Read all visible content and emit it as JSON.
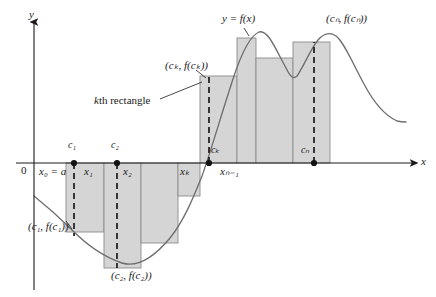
{
  "figure": {
    "title_curve_label": "y = f(x)",
    "axis": {
      "y_label": "y",
      "x_label": "x",
      "origin_label": "0",
      "axis_color": "#1a1a1a",
      "x_axis_y": 163,
      "y_axis_x": 34,
      "x_axis_left": 34,
      "x_axis_right": 418,
      "y_axis_top": 18
    },
    "colors": {
      "rect_fill": "#d5d5d5",
      "rect_stroke": "#8c8c8c",
      "curve": "#6e6e6e",
      "dash": "#1a1a1a",
      "text": "#1a1a1a",
      "background": "#ffffff"
    },
    "annotations": [
      {
        "name": "curve-label",
        "text": "y = f(x)",
        "x": 222,
        "y": 14
      },
      {
        "name": "cn-point-label",
        "text": "(cₙ, f(cₙ))",
        "x": 327,
        "y": 14
      },
      {
        "name": "ck-point-label",
        "text": "(cₖ, f(cₖ))",
        "x": 166,
        "y": 61
      },
      {
        "name": "kth-rectangle-label",
        "text": "kth rectangle",
        "x": 95,
        "y": 97
      },
      {
        "name": "c1-point-label",
        "text": "(c₁, f(c₁))",
        "x": 29,
        "y": 223
      },
      {
        "name": "c2-point-label",
        "text": "(c₂, f(c₂))",
        "x": 112,
        "y": 272
      }
    ],
    "sample_point_labels": [
      {
        "name": "c1-label",
        "text": "c₁",
        "x": 70,
        "y": 142
      },
      {
        "name": "c2-label",
        "text": "c₂",
        "x": 113,
        "y": 142
      },
      {
        "name": "ck-label",
        "text": "cₖ",
        "x": 212,
        "y": 146
      },
      {
        "name": "cn-label",
        "text": "cₙ",
        "x": 302,
        "y": 146
      }
    ],
    "partition_labels": [
      {
        "name": "x0-label",
        "text": "x₀ = a",
        "x": 40,
        "y": 167
      },
      {
        "name": "x1-label",
        "text": "x₁",
        "x": 85,
        "y": 167
      },
      {
        "name": "x2-label",
        "text": "x₂",
        "x": 124,
        "y": 167
      },
      {
        "name": "xk1-label",
        "text": "xₖ₋₁",
        "x": 182,
        "y": 167
      },
      {
        "name": "xk-label",
        "text": "xₖ",
        "x": 221,
        "y": 167
      },
      {
        "name": "xn1-label",
        "text": "xₙ₋₁",
        "x": 272,
        "y": 167
      },
      {
        "name": "xn-label",
        "text": "xₙ = b",
        "x": 310,
        "y": 167
      }
    ],
    "chart_data": {
      "type": "area",
      "title": "Riemann sum rectangles for y = f(x) on [a, b]",
      "xlabel": "x",
      "ylabel": "y",
      "grid": false,
      "legend": null,
      "baseline_y_pixel": 163,
      "partition_points_pixel": [
        66,
        104,
        141,
        178,
        200,
        237,
        256,
        293,
        330
      ],
      "partition_labels": [
        "x0 = a",
        "x1",
        "x2",
        "",
        "xk-1",
        "xk",
        "",
        "xn-1",
        "xn = b"
      ],
      "rectangles": [
        {
          "name": "rect-1",
          "x0": 66,
          "x1": 104,
          "top_pixel": 232,
          "sign": "negative"
        },
        {
          "name": "rect-2",
          "x0": 104,
          "x1": 141,
          "top_pixel": 268,
          "sign": "negative"
        },
        {
          "name": "rect-3",
          "x0": 141,
          "x1": 178,
          "top_pixel": 243,
          "sign": "negative"
        },
        {
          "name": "rect-4",
          "x0": 178,
          "x1": 200,
          "top_pixel": 196,
          "sign": "negative"
        },
        {
          "name": "rect-k",
          "x0": 200,
          "x1": 237,
          "top_pixel": 76,
          "sign": "positive"
        },
        {
          "name": "rect-k+1",
          "x0": 237,
          "x1": 256,
          "top_pixel": 38,
          "sign": "positive"
        },
        {
          "name": "rect-k+2",
          "x0": 256,
          "x1": 293,
          "top_pixel": 58,
          "sign": "positive"
        },
        {
          "name": "rect-n",
          "x0": 293,
          "x1": 330,
          "top_pixel": 42,
          "sign": "positive"
        }
      ],
      "sample_points_pixel": [
        {
          "label": "c1",
          "x": 74,
          "y_on_axis": 163
        },
        {
          "label": "c2",
          "x": 117,
          "y_on_axis": 163
        },
        {
          "label": "ck",
          "x": 209,
          "y_on_axis": 163
        },
        {
          "label": "cn",
          "x": 314,
          "y_on_axis": 163
        }
      ],
      "curve_points_pixel": [
        [
          34,
          196
        ],
        [
          45,
          205
        ],
        [
          58,
          216
        ],
        [
          72,
          230
        ],
        [
          88,
          245
        ],
        [
          105,
          256
        ],
        [
          122,
          263
        ],
        [
          138,
          263
        ],
        [
          152,
          257
        ],
        [
          165,
          245
        ],
        [
          178,
          228
        ],
        [
          190,
          205
        ],
        [
          200,
          180
        ],
        [
          210,
          150
        ],
        [
          220,
          115
        ],
        [
          230,
          80
        ],
        [
          240,
          52
        ],
        [
          250,
          36
        ],
        [
          258,
          32
        ],
        [
          266,
          40
        ],
        [
          275,
          56
        ],
        [
          285,
          72
        ],
        [
          293,
          79
        ],
        [
          300,
          72
        ],
        [
          308,
          56
        ],
        [
          316,
          42
        ],
        [
          325,
          34
        ],
        [
          334,
          34
        ],
        [
          344,
          44
        ],
        [
          356,
          65
        ],
        [
          370,
          90
        ],
        [
          382,
          108
        ],
        [
          394,
          118
        ],
        [
          404,
          122
        ]
      ]
    }
  }
}
